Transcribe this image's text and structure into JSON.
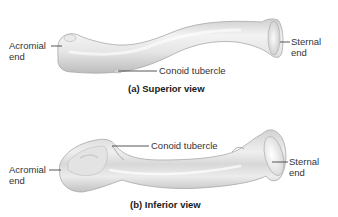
{
  "figure": {
    "panels": [
      {
        "id": "a",
        "caption": "(a) Superior view",
        "labels": {
          "acromial": [
            "Acromial",
            "end"
          ],
          "conoid": "Conoid tubercle",
          "sternal": [
            "Sternal",
            "end"
          ]
        }
      },
      {
        "id": "b",
        "caption": "(b) Inferior view",
        "labels": {
          "acromial": [
            "Acromial",
            "end"
          ],
          "conoid": "Conoid tubercle",
          "sternal": [
            "Sternal",
            "end"
          ]
        }
      }
    ]
  },
  "colors": {
    "background": "#ffffff",
    "bone_light": "#f1f1f1",
    "bone_mid": "#dcdcdc",
    "bone_shadow": "#b9b9b9",
    "leader_line": "#444444",
    "label_text": "#333333"
  }
}
